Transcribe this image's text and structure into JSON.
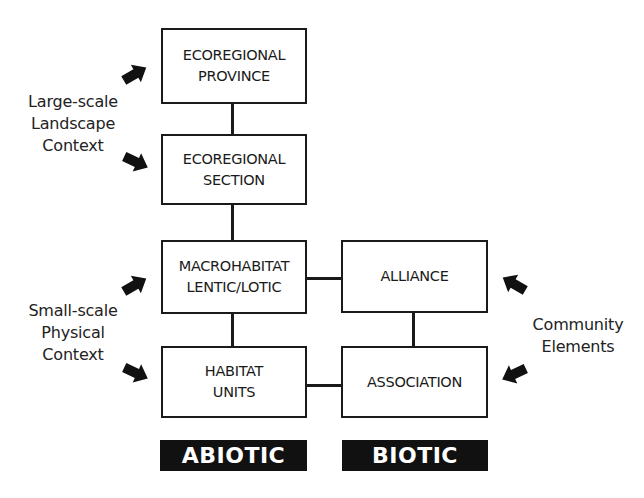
{
  "abiotic_column": {
    "boxes": [
      {
        "lines": [
          "ECOREGIONAL",
          "PROVINCE"
        ]
      },
      {
        "lines": [
          "ECOREGIONAL",
          "SECTION"
        ]
      },
      {
        "lines": [
          "MACROHABITAT",
          "LENTIC/LOTIC"
        ]
      },
      {
        "lines": [
          "HABITAT",
          "UNITS"
        ]
      }
    ],
    "footer_label": "ABIOTIC"
  },
  "biotic_column": {
    "boxes": [
      {
        "lines": [
          "ALLIANCE"
        ]
      },
      {
        "lines": [
          "ASSOCIATION"
        ]
      }
    ],
    "footer_label": "BIOTIC"
  },
  "side_labels": {
    "large_scale": {
      "lines": [
        "Large-scale",
        "Landscape",
        "Context"
      ]
    },
    "small_scale": {
      "lines": [
        "Small-scale",
        "Physical",
        "Context"
      ]
    },
    "community": {
      "lines": [
        "Community",
        "Elements"
      ]
    }
  },
  "arrows": [
    {
      "icon": "arrow-up-right-icon",
      "target": "ECOREGIONAL PROVINCE"
    },
    {
      "icon": "arrow-down-right-icon",
      "target": "ECOREGIONAL SECTION"
    },
    {
      "icon": "arrow-up-right-icon",
      "target": "MACROHABITAT LENTIC/LOTIC"
    },
    {
      "icon": "arrow-down-right-icon",
      "target": "HABITAT UNITS"
    },
    {
      "icon": "arrow-up-left-icon",
      "target": "ALLIANCE"
    },
    {
      "icon": "arrow-down-left-icon",
      "target": "ASSOCIATION"
    }
  ],
  "colors": {
    "line": "#1a1a1a",
    "label_bar_bg": "#111111",
    "label_bar_text": "#ffffff",
    "background": "#ffffff"
  }
}
